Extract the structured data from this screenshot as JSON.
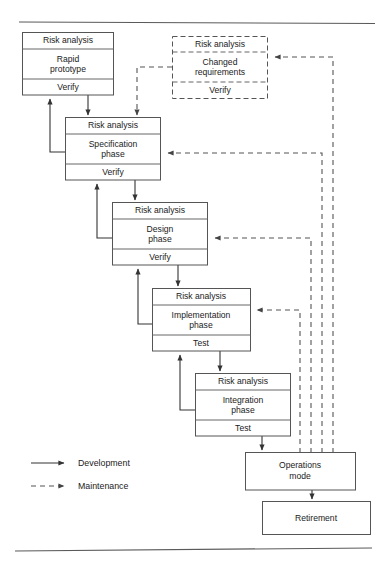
{
  "figure": {
    "top_rule": true,
    "bottom_rule": true
  },
  "legend": {
    "items": [
      {
        "label": "Development",
        "line_style": "solid",
        "color": "#333333"
      },
      {
        "label": "Maintenance",
        "line_style": "dashed",
        "color": "#555555"
      }
    ]
  },
  "phases": {
    "rapid_prototype": {
      "header": "Risk analysis",
      "body_line1": "Rapid",
      "body_line2": "prototype",
      "footer": "Verify",
      "style": "solid"
    },
    "changed_requirements": {
      "header": "Risk analysis",
      "body_line1": "Changed",
      "body_line2": "requirements",
      "footer": "Verify",
      "style": "dashed"
    },
    "specification": {
      "header": "Risk analysis",
      "body_line1": "Specification",
      "body_line2": "phase",
      "footer": "Verify",
      "style": "solid"
    },
    "design": {
      "header": "Risk analysis",
      "body_line1": "Design",
      "body_line2": "phase",
      "footer": "Verify",
      "style": "solid"
    },
    "implementation": {
      "header": "Risk analysis",
      "body_line1": "Implementation",
      "body_line2": "phase",
      "footer": "Test",
      "style": "solid"
    },
    "integration": {
      "header": "Risk analysis",
      "body_line1": "Integration",
      "body_line2": "phase",
      "footer": "Test",
      "style": "solid"
    },
    "operations": {
      "body_line1": "Operations",
      "body_line2": "mode",
      "style": "solid"
    },
    "retirement": {
      "body_line1": "Retirement",
      "style": "solid"
    }
  },
  "colors": {
    "box_stroke": "#555555",
    "development_arrow": "#333333",
    "maintenance_arrow": "#555555",
    "rule": "#5a5a5a",
    "background": "#ffffff"
  }
}
